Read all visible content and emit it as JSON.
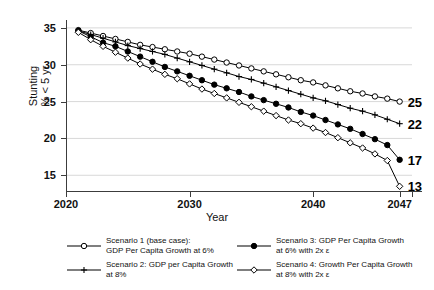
{
  "chart_data": {
    "type": "line",
    "title": "",
    "xlabel": "Year",
    "ylabel": "Stunting\n% < 5 yr",
    "ylabel_line1": "Stunting",
    "ylabel_line2": "% < 5 yr",
    "xlim": [
      2020,
      2048
    ],
    "ylim": [
      13,
      35.8
    ],
    "grid": true,
    "legend_position": "bottom",
    "yticks": [
      15,
      20,
      25,
      30,
      35
    ],
    "ytick_labels": [
      "15",
      "20",
      "25",
      "30",
      "35"
    ],
    "xticks": [
      2020,
      2030,
      2040,
      2047
    ],
    "xtick_labels": [
      "2020",
      "2030",
      "2040",
      "2047"
    ],
    "x": [
      2021,
      2022,
      2023,
      2024,
      2025,
      2026,
      2027,
      2028,
      2029,
      2030,
      2031,
      2032,
      2033,
      2034,
      2035,
      2036,
      2037,
      2038,
      2039,
      2040,
      2041,
      2042,
      2043,
      2044,
      2045,
      2046,
      2047
    ],
    "series": [
      {
        "name": "Scenario 1 (base case): GDP Per Capita Growth at 6%",
        "marker": "open-circle",
        "end_label": "25",
        "values": [
          34.7,
          34.3,
          33.9,
          33.5,
          33.1,
          32.7,
          32.4,
          32.1,
          31.8,
          31.5,
          31.1,
          30.7,
          30.3,
          29.9,
          29.5,
          29.1,
          28.7,
          28.3,
          27.9,
          27.6,
          27.2,
          26.8,
          26.4,
          26.1,
          25.7,
          25.4,
          25.0
        ]
      },
      {
        "name": "Scenario 2: GDP per Capita Growth at 8%",
        "marker": "plus",
        "end_label": "22",
        "values": [
          34.6,
          34.1,
          33.6,
          33.1,
          32.6,
          32.2,
          31.8,
          31.4,
          30.9,
          30.4,
          29.9,
          29.4,
          28.9,
          28.4,
          28.0,
          27.5,
          27.0,
          26.5,
          26.0,
          25.5,
          25.1,
          24.6,
          24.1,
          23.7,
          23.2,
          22.6,
          22.0
        ]
      },
      {
        "name": "Scenario 3: GDP Per Capita Growth at 6% with 2x ε",
        "marker": "filled-circle",
        "end_label": "17",
        "values": [
          34.6,
          33.8,
          33.0,
          32.5,
          31.8,
          31.1,
          30.4,
          29.7,
          29.1,
          28.5,
          27.9,
          27.3,
          26.8,
          26.3,
          25.7,
          25.2,
          24.7,
          24.2,
          23.6,
          23.1,
          22.5,
          21.9,
          21.3,
          20.6,
          19.9,
          19.1,
          17.1
        ]
      },
      {
        "name": "Scenario 4: Growth Per Capita Growth at 8% with 2x ε",
        "marker": "open-diamond",
        "end_label": "13",
        "values": [
          34.4,
          33.4,
          32.5,
          31.7,
          30.9,
          30.1,
          29.4,
          28.7,
          28.1,
          27.4,
          26.7,
          26.1,
          25.5,
          24.9,
          24.3,
          23.7,
          23.1,
          22.5,
          22.0,
          21.4,
          20.8,
          20.1,
          19.4,
          18.7,
          17.9,
          17.0,
          13.5
        ]
      }
    ]
  },
  "legend": {
    "items": [
      {
        "marker": "open-circle",
        "label": "Scenario 1 (base case):\nGDP Per Capita Growth at 6%"
      },
      {
        "marker": "plus",
        "label": " Scenario 2: GDP per Capita Growth\nat 8%"
      },
      {
        "marker": "filled-circle",
        "label": "Scenario 3: GDP Per Capita Growth\nat 6% with 2x ε"
      },
      {
        "marker": "open-diamond",
        "label": "Scenario 4: Growth Per Capita Growth\nat 8% with 2x ε"
      }
    ]
  },
  "colors": {
    "series": "#000000",
    "axis": "#3c3c3c",
    "grid": "#d8d8d8",
    "background": "#ffffff"
  }
}
